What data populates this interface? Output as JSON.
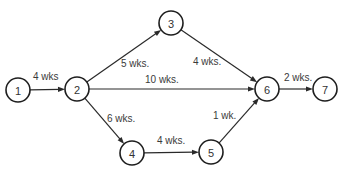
{
  "diagram": {
    "type": "network-diagram",
    "nodes": [
      {
        "id": "1",
        "label": "1"
      },
      {
        "id": "2",
        "label": "2"
      },
      {
        "id": "3",
        "label": "3"
      },
      {
        "id": "4",
        "label": "4"
      },
      {
        "id": "5",
        "label": "5"
      },
      {
        "id": "6",
        "label": "6"
      },
      {
        "id": "7",
        "label": "7"
      }
    ],
    "edges": [
      {
        "from": "1",
        "to": "2",
        "label": "4 wks"
      },
      {
        "from": "2",
        "to": "3",
        "label": "5 wks."
      },
      {
        "from": "2",
        "to": "6",
        "label": "10 wks."
      },
      {
        "from": "2",
        "to": "4",
        "label": "6 wks."
      },
      {
        "from": "3",
        "to": "6",
        "label": "4 wks."
      },
      {
        "from": "4",
        "to": "5",
        "label": "4 wks."
      },
      {
        "from": "5",
        "to": "6",
        "label": "1 wk."
      },
      {
        "from": "6",
        "to": "7",
        "label": "2 wks."
      }
    ]
  }
}
